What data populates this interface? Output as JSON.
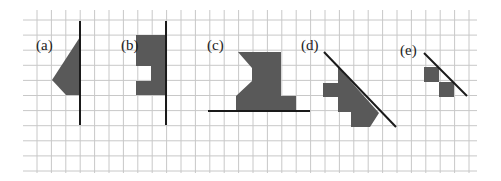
{
  "diagram": {
    "grid": {
      "x0": 37,
      "dx": 14.4,
      "cols": 31,
      "y0": 20,
      "dy": 15.1,
      "rows": 11,
      "h_extent": [
        23,
        477
      ],
      "v_extent": [
        10,
        173
      ],
      "color": "#c8c8c8"
    },
    "colors": {
      "shape": "#595959",
      "line": "#1a1a1a"
    },
    "figures": [
      {
        "label": "(a)",
        "label_pos": [
          36,
          50
        ],
        "mirror_line": [
          [
            80,
            21
          ],
          [
            80,
            125
          ]
        ],
        "polygons": [
          [
            [
              80,
              37
            ],
            [
              52,
              80
            ],
            [
              66,
              95
            ],
            [
              80,
              95
            ]
          ]
        ]
      },
      {
        "label": "(b)",
        "label_pos": [
          121,
          50
        ],
        "mirror_line": [
          [
            166,
            21
          ],
          [
            166,
            125
          ]
        ],
        "polygons": [
          [
            [
              136,
              35
            ],
            [
              166,
              35
            ],
            [
              166,
              95
            ],
            [
              136,
              95
            ],
            [
              136,
              81
            ],
            [
              151,
              81
            ],
            [
              151,
              66
            ],
            [
              136,
              66
            ]
          ]
        ]
      },
      {
        "label": "(c)",
        "label_pos": [
          207,
          50
        ],
        "mirror_line": [
          [
            208,
            111
          ],
          [
            310,
            111
          ]
        ],
        "polygons": [
          [
            [
              238,
              52
            ],
            [
              281,
              52
            ],
            [
              281,
              96
            ],
            [
              296,
              96
            ],
            [
              296,
              111
            ],
            [
              236,
              111
            ],
            [
              236,
              96
            ],
            [
              252,
              81
            ],
            [
              252,
              68
            ]
          ]
        ]
      },
      {
        "label": "(d)",
        "label_pos": [
          301,
          50
        ],
        "mirror_line": [
          [
            324,
            52
          ],
          [
            396,
            127
          ]
        ],
        "polygons": [
          [
            [
              338,
              67
            ],
            [
              379,
              113
            ],
            [
              370,
              127
            ],
            [
              351,
              127
            ],
            [
              351,
              112
            ],
            [
              338,
              112
            ],
            [
              338,
              97
            ],
            [
              323,
              97
            ],
            [
              323,
              83
            ],
            [
              338,
              83
            ]
          ]
        ]
      },
      {
        "label": "(e)",
        "label_pos": [
          400,
          55
        ],
        "mirror_line": [
          [
            424,
            53
          ],
          [
            467,
            96
          ]
        ],
        "polygons": [
          [
            [
              424,
              67
            ],
            [
              439,
              67
            ],
            [
              439,
              82
            ],
            [
              424,
              82
            ]
          ],
          [
            [
              439,
              82
            ],
            [
              454,
              82
            ],
            [
              454,
              97
            ],
            [
              439,
              97
            ]
          ]
        ]
      }
    ]
  }
}
